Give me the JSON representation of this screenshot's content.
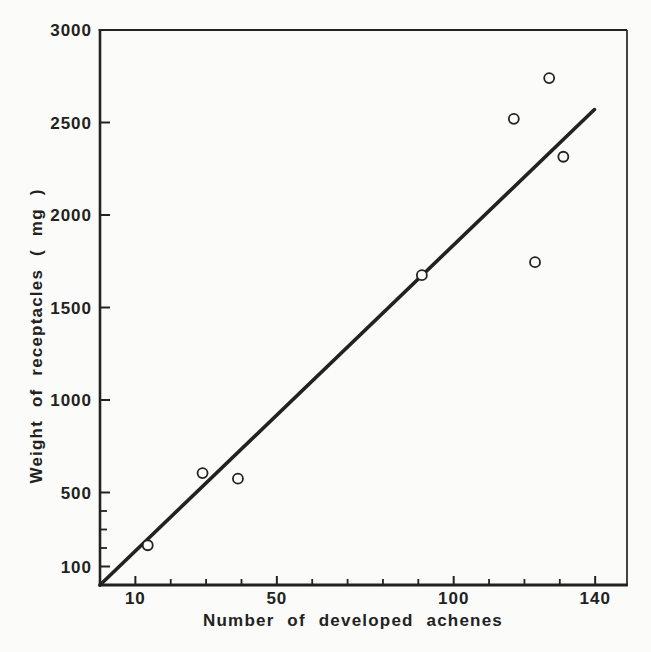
{
  "chart_data": {
    "type": "scatter",
    "title": "",
    "xlabel": "Number of developed achenes",
    "ylabel": "Weight of receptacles ( mg )",
    "xlim": [
      0,
      149
    ],
    "ylim": [
      0,
      3000
    ],
    "grid": false,
    "legend": null,
    "x_ticks_labeled": [
      10,
      50,
      100,
      140
    ],
    "x_ticks_minor": [
      20,
      30,
      40,
      60,
      70,
      80,
      90,
      110,
      120,
      130
    ],
    "y_ticks_labeled": [
      100,
      500,
      1000,
      1500,
      2000,
      2500,
      3000
    ],
    "y_ticks_minor": [
      200,
      300,
      400
    ],
    "points": [
      {
        "x": 13.5,
        "y": 215
      },
      {
        "x": 29,
        "y": 605
      },
      {
        "x": 39,
        "y": 575
      },
      {
        "x": 91,
        "y": 1675
      },
      {
        "x": 117,
        "y": 2520
      },
      {
        "x": 123,
        "y": 1745
      },
      {
        "x": 127,
        "y": 2740
      },
      {
        "x": 131,
        "y": 2315
      }
    ],
    "regression_line": {
      "x1": 0,
      "y1": 0,
      "x2": 139.8,
      "y2": 2570
    },
    "marker": {
      "shape": "circle-open",
      "radius_px": 5
    },
    "ink_color": "#222220",
    "background_color": "#fbfbfa"
  }
}
